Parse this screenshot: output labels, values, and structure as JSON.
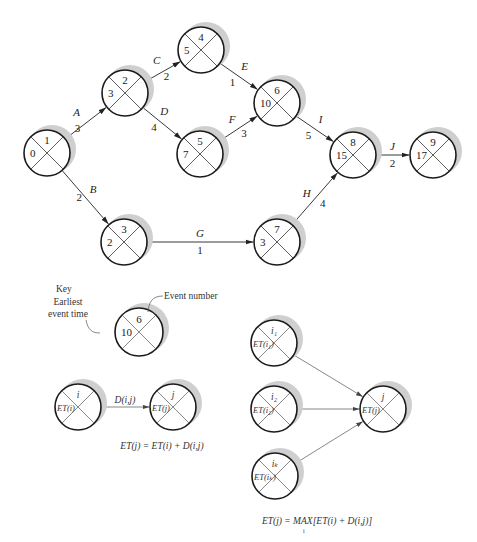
{
  "network": {
    "nodes": [
      {
        "id": "1",
        "event": "1",
        "et": "0"
      },
      {
        "id": "2",
        "event": "2",
        "et": "3"
      },
      {
        "id": "3",
        "event": "3",
        "et": "2"
      },
      {
        "id": "4",
        "event": "4",
        "et": "5"
      },
      {
        "id": "5",
        "event": "5",
        "et": "7"
      },
      {
        "id": "6",
        "event": "6",
        "et": "10"
      },
      {
        "id": "7",
        "event": "7",
        "et": "3"
      },
      {
        "id": "8",
        "event": "8",
        "et": "15"
      },
      {
        "id": "9",
        "event": "9",
        "et": "17"
      }
    ],
    "activities": [
      {
        "name": "A",
        "from": "1",
        "to": "2",
        "duration": "3"
      },
      {
        "name": "B",
        "from": "1",
        "to": "3",
        "duration": "2"
      },
      {
        "name": "C",
        "from": "2",
        "to": "4",
        "duration": "2"
      },
      {
        "name": "D",
        "from": "2",
        "to": "5",
        "duration": "4"
      },
      {
        "name": "E",
        "from": "4",
        "to": "6",
        "duration": "1"
      },
      {
        "name": "F",
        "from": "5",
        "to": "6",
        "duration": "3"
      },
      {
        "name": "G",
        "from": "3",
        "to": "7",
        "duration": "1"
      },
      {
        "name": "H",
        "from": "7",
        "to": "8",
        "duration": "4"
      },
      {
        "name": "I",
        "from": "6",
        "to": "8",
        "duration": "5"
      },
      {
        "name": "J",
        "from": "8",
        "to": "9",
        "duration": "2"
      }
    ]
  },
  "key": {
    "title": "Key",
    "earliest_label_line1": "Earliest",
    "earliest_label_line2": "event time",
    "event_number_label": "Event number",
    "sample_event": "6",
    "sample_et": "10"
  },
  "formula_simple": {
    "node_i_event": "i",
    "node_i_et": "ET(i)",
    "node_j_event": "j",
    "node_j_et": "ET(j)",
    "edge_label": "D(i,j)",
    "equation": "ET(j) = ET(i) + D(i,j)"
  },
  "formula_max": {
    "predecessors": [
      {
        "event": "i₁",
        "et": "ET(i₁)"
      },
      {
        "event": "i₂",
        "et": "ET(i₂)"
      },
      {
        "event": "iₖ",
        "et": "ET(iₖ)"
      }
    ],
    "node_j_event": "j",
    "node_j_et": "ET(j)",
    "equation": "ET(j) = MAX[ET(i) + D(i,j)]",
    "equation_subscript": "i"
  }
}
